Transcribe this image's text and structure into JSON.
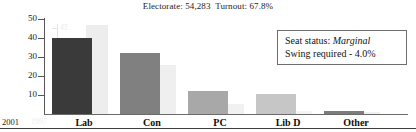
{
  "header": {
    "electorate_label": "Electorate:",
    "electorate_value": "54,283",
    "turnout_label": "Turnout:",
    "turnout_value": "67.8%",
    "full_text": "Electorate: 54,283  Turnout: 67.8%"
  },
  "info_box": {
    "seat_status_label": "Seat status:",
    "seat_status_value": "Marginal",
    "swing_line": "Swing required - 4.0%"
  },
  "axis": {
    "year_current": "2001",
    "year_previous": "1997",
    "primary_ticks": [
      "50",
      "40",
      "30",
      "20",
      "10"
    ],
    "secondary_ticks": [
      "45",
      "35",
      "25",
      "15",
      "5"
    ]
  },
  "colors": {
    "bar_lab": "#3a3a3a",
    "bar_con": "#808080",
    "bar_pc": "#a8a8a8",
    "bar_libd": "#c6c6c6",
    "bar_other": "#7c7c7c",
    "bar_prev": "#ededed",
    "bar_prev_light": "#f4f4f4",
    "axis": "#555555",
    "axis_faded": "#e6e6e6",
    "text": "#1a1a1a",
    "box_border": "#6d6d6d"
  },
  "chart_data": {
    "type": "bar",
    "title": "",
    "subtitle": "Electorate: 54,283  Turnout: 67.8%",
    "xlabel": "",
    "ylabel": "",
    "ylim": [
      0,
      52
    ],
    "grid": false,
    "legend_position": "none",
    "categories": [
      "Lab",
      "Con",
      "PC",
      "Lib D",
      "Other"
    ],
    "series": [
      {
        "name": "2001",
        "values": [
          41.3,
          32.9,
          12.6,
          10.9,
          1.4
        ],
        "colors": [
          "#3a3a3a",
          "#808080",
          "#a8a8a8",
          "#c6c6c6",
          "#7c7c7c"
        ]
      },
      {
        "name": "1997",
        "values": [
          48.2,
          26.5,
          5.6,
          1.8,
          1.2
        ],
        "colors": [
          "#ededed",
          "#efefef",
          "#f1f1f1",
          "#f4f4f4",
          "#f0f0f0"
        ]
      }
    ],
    "primary_axis_ticks": [
      10,
      20,
      30,
      40,
      50
    ],
    "secondary_axis_ticks": [
      5,
      15,
      25,
      35,
      45
    ],
    "annotations": [
      "Seat status: Marginal",
      "Swing required - 4.0%"
    ]
  }
}
